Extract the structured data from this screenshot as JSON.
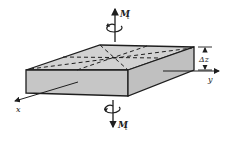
{
  "diagram": {
    "labels": {
      "moment_top": "M",
      "moment_top_sub": "t",
      "moment_bottom": "M",
      "moment_bottom_sub": "t",
      "thickness": "Δz",
      "axis_x": "x",
      "axis_y": "y"
    },
    "colors": {
      "face_fill": "#c8c8c8",
      "top_fill": "#d2d2d2",
      "side_fill": "#bdbdbd",
      "stroke": "#1e1e1e",
      "background": "#ffffff"
    }
  }
}
